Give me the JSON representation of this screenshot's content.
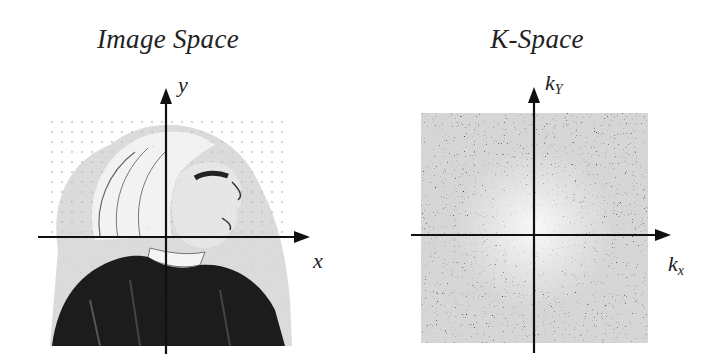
{
  "panels": [
    {
      "id": "image-space",
      "title": "Image Space",
      "x_axis_label": "x",
      "y_axis_label": "y",
      "content": "engraved portrait of a man with long white hair in profile, over a dotted grid"
    },
    {
      "id": "k-space",
      "title": "K-Space",
      "x_axis_label": "k",
      "x_axis_subscript": "x",
      "y_axis_label": "k",
      "y_axis_subscript": "Y",
      "content": "noise-like grayscale k-space magnitude pattern, brighter near the center"
    }
  ],
  "colors": {
    "background": "#ffffff",
    "axis": "#111111",
    "text": "#222222"
  }
}
